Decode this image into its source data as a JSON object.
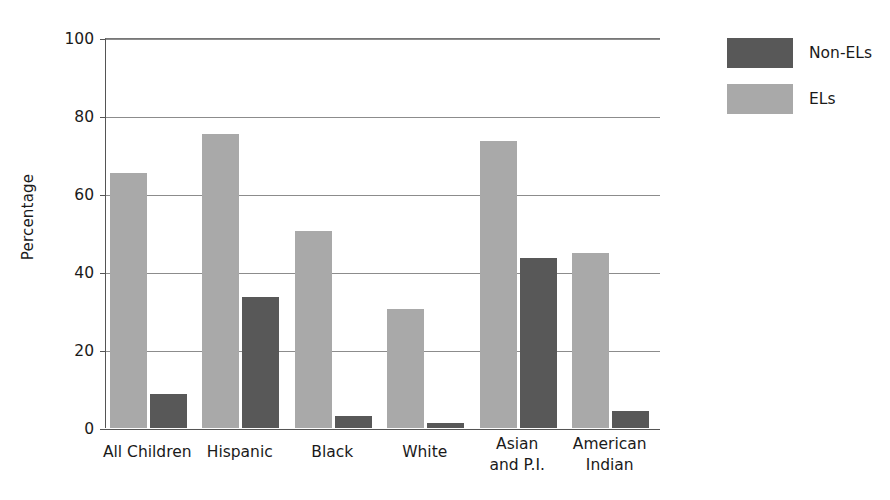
{
  "chart_data": {
    "type": "bar",
    "title": "",
    "xlabel": "",
    "ylabel": "Percentage",
    "ylim": [
      0,
      100
    ],
    "yticks": [
      0,
      20,
      40,
      60,
      80,
      100
    ],
    "grid": true,
    "legend_position": "right",
    "categories": [
      "All Children",
      "Hispanic",
      "Black",
      "White",
      "Asian and P.I.",
      "American Indian"
    ],
    "series": [
      {
        "name": "Non-ELs",
        "color": "#585858",
        "values": [
          8.7,
          33.5,
          3.0,
          1.2,
          43.6,
          4.4
        ]
      },
      {
        "name": "ELs",
        "color": "#a9a9a9",
        "values": [
          65.5,
          75.5,
          50.5,
          30.5,
          73.7,
          44.8
        ]
      }
    ]
  },
  "axes": {
    "y_title": "Percentage",
    "y_tick_labels": [
      "0",
      "20",
      "40",
      "60",
      "80",
      "100"
    ],
    "x_tick_labels": [
      {
        "line1": "All Children",
        "line2": ""
      },
      {
        "line1": "Hispanic",
        "line2": ""
      },
      {
        "line1": "Black",
        "line2": ""
      },
      {
        "line1": "White",
        "line2": ""
      },
      {
        "line1": "Asian",
        "line2": "and P.I."
      },
      {
        "line1": "American",
        "line2": "Indian"
      }
    ]
  },
  "legend": {
    "items": [
      {
        "label": "Non-ELs",
        "color": "#585858"
      },
      {
        "label": "ELs",
        "color": "#a9a9a9"
      }
    ]
  }
}
